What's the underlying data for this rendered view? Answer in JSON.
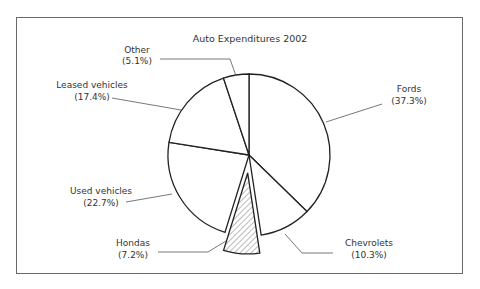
{
  "chart_data": {
    "type": "pie",
    "title": "Auto Expenditures 2002",
    "categories": [
      "Fords",
      "Chevrolets",
      "Hondas",
      "Used vehicles",
      "Leased vehicles",
      "Other"
    ],
    "values": [
      37.3,
      10.3,
      7.2,
      22.7,
      17.4,
      5.1
    ],
    "value_labels": [
      "(37.3%)",
      "(10.3%)",
      "(7.2%)",
      "(22.7%)",
      "(17.4%)",
      "(5.1%)"
    ],
    "exploded": [
      "Hondas"
    ],
    "hatched": [
      "Hondas"
    ],
    "start_angle": "12 o'clock",
    "direction": "clockwise",
    "legend": "none (leader-line labels)",
    "colors": {
      "slice_fill": "#ffffff",
      "outline": "#222222",
      "hatch": "#555555",
      "leader": "#555555"
    }
  },
  "labels": {
    "title": "Auto Expenditures 2002",
    "fords": {
      "name": "Fords",
      "pct": "(37.3%)"
    },
    "chevrolets": {
      "name": "Chevrolets",
      "pct": "(10.3%)"
    },
    "hondas": {
      "name": "Hondas",
      "pct": "(7.2%)"
    },
    "used": {
      "name": "Used vehicles",
      "pct": "(22.7%)"
    },
    "leased": {
      "name": "Leased vehicles",
      "pct": "(17.4%)"
    },
    "other": {
      "name": "Other",
      "pct": "(5.1%)"
    }
  }
}
